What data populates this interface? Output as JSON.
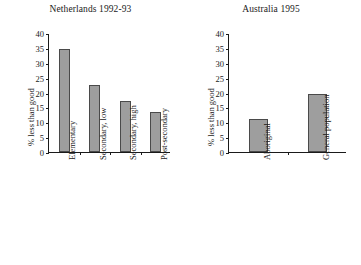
{
  "chart_data": [
    {
      "type": "bar",
      "panel": "left",
      "title": "Netherlands 1992-93",
      "categories": [
        "Elementary",
        "Secondary, low",
        "Secondary, high",
        "Post-secondary"
      ],
      "values": [
        34.5,
        22.5,
        17.3,
        13.3
      ],
      "xlabel": "",
      "ylabel": "% less than good",
      "ylim": [
        0,
        40
      ],
      "ytick_labels": [
        "0",
        "5",
        "10",
        "15",
        "20",
        "25",
        "30",
        "35",
        "40"
      ],
      "ytick_values": [
        0,
        5,
        10,
        15,
        20,
        25,
        30,
        35,
        40
      ],
      "grid": false,
      "legend": "none",
      "bar_color": "#9e9e9e",
      "bar_edge_color": "#4a4a4a"
    },
    {
      "type": "bar",
      "panel": "right",
      "title": "Australia 1995",
      "categories": [
        "Aboriginal",
        "General population"
      ],
      "values": [
        11.0,
        19.5
      ],
      "xlabel": "",
      "ylabel": "% less than good",
      "ylim": [
        0,
        40
      ],
      "ytick_labels": [
        "0",
        "5",
        "10",
        "15",
        "20",
        "25",
        "30",
        "35",
        "40"
      ],
      "ytick_values": [
        0,
        5,
        10,
        15,
        20,
        25,
        30,
        35,
        40
      ],
      "grid": false,
      "legend": "none",
      "bar_color": "#9e9e9e",
      "bar_edge_color": "#4a4a4a"
    }
  ]
}
